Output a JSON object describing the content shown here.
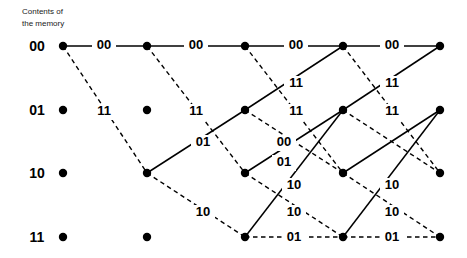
{
  "header": {
    "line1": "Contents of",
    "line2": "the memory"
  },
  "chart_data": {
    "type": "diagram",
    "subtitle": "Contents of the memory",
    "states": [
      "00",
      "01",
      "10",
      "11"
    ],
    "state_y": [
      46,
      110,
      173,
      237
    ],
    "stage_x": [
      63,
      147,
      245,
      343,
      440
    ],
    "stages": 4,
    "legend": {
      "solid": "input bit 0",
      "dashed": "input bit 1"
    },
    "nodes": [
      {
        "id": "n0-0",
        "state": "00",
        "stage": 0,
        "x": 63,
        "y": 46
      },
      {
        "id": "n0-1",
        "state": "01",
        "stage": 0,
        "x": 63,
        "y": 110
      },
      {
        "id": "n0-2",
        "state": "10",
        "stage": 0,
        "x": 63,
        "y": 173
      },
      {
        "id": "n0-3",
        "state": "11",
        "stage": 0,
        "x": 63,
        "y": 237
      },
      {
        "id": "n1-0",
        "state": "00",
        "stage": 1,
        "x": 147,
        "y": 46
      },
      {
        "id": "n1-1",
        "state": "01",
        "stage": 1,
        "x": 147,
        "y": 110
      },
      {
        "id": "n1-2",
        "state": "10",
        "stage": 1,
        "x": 147,
        "y": 173
      },
      {
        "id": "n1-3",
        "state": "11",
        "stage": 1,
        "x": 147,
        "y": 237
      },
      {
        "id": "n2-0",
        "state": "00",
        "stage": 2,
        "x": 245,
        "y": 46
      },
      {
        "id": "n2-1",
        "state": "01",
        "stage": 2,
        "x": 245,
        "y": 110
      },
      {
        "id": "n2-2",
        "state": "10",
        "stage": 2,
        "x": 245,
        "y": 173
      },
      {
        "id": "n2-3",
        "state": "11",
        "stage": 2,
        "x": 245,
        "y": 237
      },
      {
        "id": "n3-0",
        "state": "00",
        "stage": 3,
        "x": 343,
        "y": 46
      },
      {
        "id": "n3-1",
        "state": "01",
        "stage": 3,
        "x": 343,
        "y": 110
      },
      {
        "id": "n3-2",
        "state": "10",
        "stage": 3,
        "x": 343,
        "y": 173
      },
      {
        "id": "n3-3",
        "state": "11",
        "stage": 3,
        "x": 343,
        "y": 237
      },
      {
        "id": "n4-0",
        "state": "00",
        "stage": 4,
        "x": 440,
        "y": 46
      },
      {
        "id": "n4-1",
        "state": "01",
        "stage": 4,
        "x": 440,
        "y": 110
      },
      {
        "id": "n4-2",
        "state": "10",
        "stage": 4,
        "x": 440,
        "y": 173
      },
      {
        "id": "n4-3",
        "state": "11",
        "stage": 4,
        "x": 440,
        "y": 237
      }
    ],
    "edges": [
      {
        "from": "n0-0",
        "to": "n1-0",
        "style": "solid",
        "x1": 63,
        "y1": 46,
        "x2": 147,
        "y2": 46
      },
      {
        "from": "n0-0",
        "to": "n1-2",
        "style": "dashed",
        "x1": 63,
        "y1": 46,
        "x2": 147,
        "y2": 173
      },
      {
        "from": "n1-0",
        "to": "n2-0",
        "style": "solid",
        "x1": 147,
        "y1": 46,
        "x2": 245,
        "y2": 46
      },
      {
        "from": "n1-0",
        "to": "n2-2",
        "style": "dashed",
        "x1": 147,
        "y1": 46,
        "x2": 245,
        "y2": 173
      },
      {
        "from": "n1-2",
        "to": "n2-1",
        "style": "solid",
        "x1": 147,
        "y1": 173,
        "x2": 245,
        "y2": 110
      },
      {
        "from": "n1-2",
        "to": "n2-3",
        "style": "dashed",
        "x1": 147,
        "y1": 173,
        "x2": 245,
        "y2": 237
      },
      {
        "from": "n2-0",
        "to": "n3-0",
        "style": "solid",
        "x1": 245,
        "y1": 46,
        "x2": 343,
        "y2": 46
      },
      {
        "from": "n2-0",
        "to": "n3-2",
        "style": "dashed",
        "x1": 245,
        "y1": 46,
        "x2": 343,
        "y2": 173
      },
      {
        "from": "n2-1",
        "to": "n3-0",
        "style": "solid",
        "x1": 245,
        "y1": 110,
        "x2": 343,
        "y2": 46
      },
      {
        "from": "n2-1",
        "to": "n3-2",
        "style": "dashed",
        "x1": 245,
        "y1": 110,
        "x2": 343,
        "y2": 173
      },
      {
        "from": "n2-2",
        "to": "n3-1",
        "style": "solid",
        "x1": 245,
        "y1": 173,
        "x2": 343,
        "y2": 110
      },
      {
        "from": "n2-2",
        "to": "n3-3",
        "style": "dashed",
        "x1": 245,
        "y1": 173,
        "x2": 343,
        "y2": 237
      },
      {
        "from": "n2-3",
        "to": "n3-1",
        "style": "solid",
        "x1": 245,
        "y1": 237,
        "x2": 343,
        "y2": 110
      },
      {
        "from": "n2-3",
        "to": "n3-3",
        "style": "dashed",
        "x1": 245,
        "y1": 237,
        "x2": 343,
        "y2": 237
      },
      {
        "from": "n3-0",
        "to": "n4-0",
        "style": "solid",
        "x1": 343,
        "y1": 46,
        "x2": 440,
        "y2": 46
      },
      {
        "from": "n3-0",
        "to": "n4-2",
        "style": "dashed",
        "x1": 343,
        "y1": 46,
        "x2": 440,
        "y2": 173
      },
      {
        "from": "n3-1",
        "to": "n4-0",
        "style": "solid",
        "x1": 343,
        "y1": 110,
        "x2": 440,
        "y2": 46
      },
      {
        "from": "n3-1",
        "to": "n4-2",
        "style": "dashed",
        "x1": 343,
        "y1": 110,
        "x2": 440,
        "y2": 173
      },
      {
        "from": "n3-2",
        "to": "n4-1",
        "style": "solid",
        "x1": 343,
        "y1": 173,
        "x2": 440,
        "y2": 110
      },
      {
        "from": "n3-2",
        "to": "n4-3",
        "style": "dashed",
        "x1": 343,
        "y1": 173,
        "x2": 440,
        "y2": 237
      },
      {
        "from": "n3-3",
        "to": "n4-1",
        "style": "solid",
        "x1": 343,
        "y1": 237,
        "x2": 440,
        "y2": 110
      },
      {
        "from": "n3-3",
        "to": "n4-3",
        "style": "dashed",
        "x1": 343,
        "y1": 237,
        "x2": 440,
        "y2": 237
      }
    ],
    "edge_labels": [
      {
        "text": "00",
        "x": 104,
        "y": 46
      },
      {
        "text": "11",
        "x": 104,
        "y": 112
      },
      {
        "text": "00",
        "x": 196,
        "y": 46
      },
      {
        "text": "11",
        "x": 196,
        "y": 112
      },
      {
        "text": "01",
        "x": 203,
        "y": 143
      },
      {
        "text": "10",
        "x": 203,
        "y": 213
      },
      {
        "text": "00",
        "x": 296,
        "y": 46
      },
      {
        "text": "11",
        "x": 296,
        "y": 84
      },
      {
        "text": "11",
        "x": 296,
        "y": 112
      },
      {
        "text": "00",
        "x": 284,
        "y": 143
      },
      {
        "text": "01",
        "x": 284,
        "y": 163
      },
      {
        "text": "10",
        "x": 294,
        "y": 186
      },
      {
        "text": "10",
        "x": 294,
        "y": 213
      },
      {
        "text": "01",
        "x": 294,
        "y": 238
      },
      {
        "text": "00",
        "x": 392,
        "y": 46
      },
      {
        "text": "11",
        "x": 392,
        "y": 84
      },
      {
        "text": "11",
        "x": 392,
        "y": 112
      },
      {
        "text": "10",
        "x": 392,
        "y": 186
      },
      {
        "text": "10",
        "x": 392,
        "y": 213
      },
      {
        "text": "01",
        "x": 392,
        "y": 238
      }
    ]
  }
}
